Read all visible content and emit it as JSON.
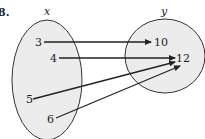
{
  "problem_label": "8.",
  "sets": {
    "domain": {
      "label": "x",
      "elements": [
        "3",
        "4",
        "5",
        "6"
      ]
    },
    "range": {
      "label": "y",
      "elements": [
        "10",
        "12"
      ]
    }
  },
  "mappings": [
    {
      "from": "3",
      "to": "10"
    },
    {
      "from": "4",
      "to": "12"
    },
    {
      "from": "5",
      "to": "12"
    },
    {
      "from": "6",
      "to": "12"
    }
  ],
  "colors": {
    "set_fill": "#ececec",
    "stroke": "#333333",
    "text": "#222222"
  }
}
